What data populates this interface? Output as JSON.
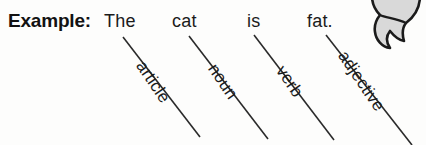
{
  "worksheet": {
    "label": "Example:",
    "sentence_words": [
      {
        "text": "The",
        "x": 104
      },
      {
        "text": "cat",
        "x": 172
      },
      {
        "text": "is",
        "x": 247
      },
      {
        "text": "fat.",
        "x": 307
      }
    ],
    "annotations": [
      {
        "label": "article",
        "tag_x": 148,
        "tag_y": 57,
        "line": {
          "x1": 123,
          "y1": 37,
          "x2": 200,
          "y2": 137
        }
      },
      {
        "label": "noun",
        "tag_x": 220,
        "tag_y": 60,
        "line": {
          "x1": 189,
          "y1": 36,
          "x2": 268,
          "y2": 139
        }
      },
      {
        "label": "verb",
        "tag_x": 288,
        "tag_y": 62,
        "line": {
          "x1": 254,
          "y1": 35,
          "x2": 334,
          "y2": 140
        }
      },
      {
        "label": "adjective",
        "tag_x": 350,
        "tag_y": 47,
        "line": {
          "x1": 326,
          "y1": 35,
          "x2": 412,
          "y2": 145
        }
      }
    ],
    "colors": {
      "ink": "#1b1b1b",
      "line": "#2a2a2a",
      "background": "#fdfdfc",
      "clipart_fill": "#d9d9d9",
      "clipart_stroke": "#1b1b1b"
    },
    "clipart": "cat-icon"
  }
}
